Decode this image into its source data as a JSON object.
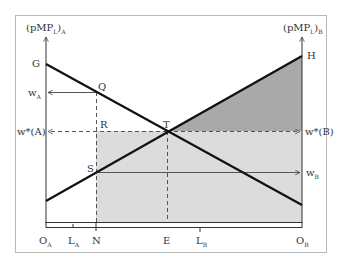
{
  "diagram": {
    "type": "specific-factors labor allocation diagram",
    "axes": {
      "left_title": "(pMP",
      "left_title_sub1": "L",
      "left_title_close": ")",
      "left_title_sub2": "A",
      "right_title": "(pMP",
      "right_title_sub1": "L",
      "right_title_close": ")",
      "right_title_sub2": "B"
    },
    "points": {
      "G": "G",
      "H": "H",
      "Q": "Q",
      "R": "R",
      "S": "S",
      "T": "T"
    },
    "left_labels": {
      "wA": "w",
      "wA_sub": "A",
      "wstarA": "w*(A)"
    },
    "right_labels": {
      "wstarB": "w*(B)",
      "wB": "w",
      "wB_sub": "B"
    },
    "bottom_labels": {
      "OA": "O",
      "OA_sub": "A",
      "LA": "L",
      "LA_sub": "A",
      "N": "N",
      "E": "E",
      "LB": "L",
      "LB_sub": "B",
      "OB": "O",
      "OB_sub": "B"
    },
    "colors": {
      "frame": "#b8b8b8",
      "line": "#111111",
      "light_shade": "#dcdcdc",
      "dark_shade": "#a9a9a9",
      "arrow": "#555555"
    }
  }
}
